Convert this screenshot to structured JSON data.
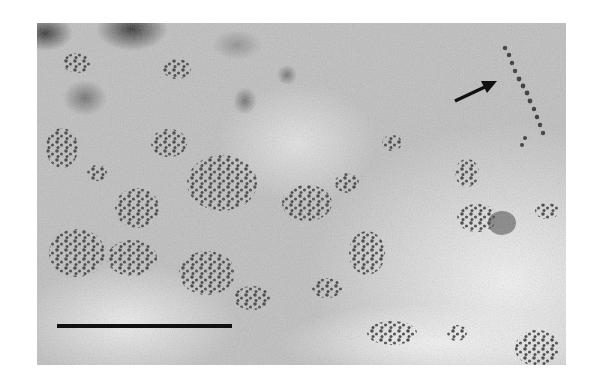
{
  "image": {
    "type": "electron-micrograph",
    "colors": {
      "background": "#ffffff",
      "field": "#c9c9c9",
      "particle": "#3a3a3a",
      "scale_bar": "#111111",
      "arrow": "#111111"
    },
    "scale_bar": {
      "x1": 20,
      "x2": 195,
      "y": 303
    },
    "arrow": {
      "x1": 418,
      "y1": 78,
      "x2": 460,
      "y2": 58
    }
  }
}
